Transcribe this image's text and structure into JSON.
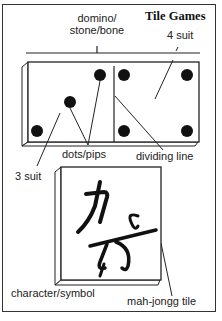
{
  "title": "Tile Games",
  "labels": {
    "domino": [
      "domino/",
      "stone/bone"
    ],
    "four_suit": "4 suit",
    "three_suit": "3 suit",
    "dots_pips": "dots/pips",
    "dividing_line": "dividing line",
    "character_symbol": "character/symbol",
    "mahjongg_tile": "mah-jongg tile"
  },
  "domino": {
    "left_half_pips": 3,
    "right_half_pips": 4
  },
  "colors": {
    "ink": "#111111",
    "frame": "#333333",
    "background": "#ffffff"
  }
}
